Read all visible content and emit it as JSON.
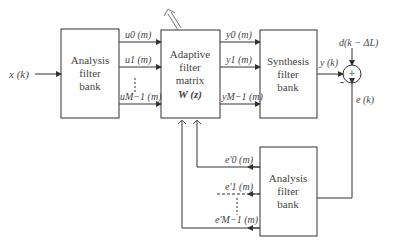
{
  "diagram": {
    "input": "x (k)",
    "analysis_top": [
      "Analysis",
      "filter",
      "bank"
    ],
    "adaptive": [
      "Adaptive",
      "filter",
      "matrix",
      "W (z)"
    ],
    "synthesis": [
      "Synthesis",
      "filter",
      "bank"
    ],
    "analysis_bottom": [
      "Analysis",
      "filter",
      "bank"
    ],
    "u_labels": [
      "u0 (m)",
      "u1 (m)",
      "uM−1 (m)"
    ],
    "y_labels": [
      "y0 (m)",
      "y1 (m)",
      "yM−1 (m)"
    ],
    "e_labels": [
      "e'0 (m)",
      "e'1 (m)",
      "e'M−1 (m)"
    ],
    "output": "y (k)",
    "desired": "d(k − ΔL)",
    "error": "e (k)",
    "sum_symbol": "+",
    "minus_sign": "-"
  }
}
